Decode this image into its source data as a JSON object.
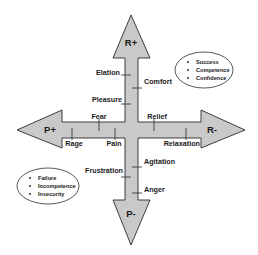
{
  "diagram": {
    "colors": {
      "arrow_fill": "#c9c9c9",
      "arrow_stroke": "#2a2a2a",
      "background": "#ffffff",
      "text": "#1a1a1a"
    },
    "poles": {
      "top": "R+",
      "bottom": "P-",
      "left": "P+",
      "right": "R-"
    },
    "axis_labels": {
      "elation": "Elation",
      "comfort": "Comfort",
      "pleasure": "Pleasure",
      "fear": "Fear",
      "relief": "Relief",
      "rage": "Rage",
      "pain": "Pain",
      "relaxation": "Relaxation",
      "agitation": "Agitation",
      "frustration": "Frustration",
      "anger": "Anger"
    },
    "positive_ellipse": {
      "items": [
        "Success",
        "Competence",
        "Confidence"
      ]
    },
    "negative_ellipse": {
      "items": [
        "Failure",
        "Incompetence",
        "Insecurity"
      ]
    }
  }
}
